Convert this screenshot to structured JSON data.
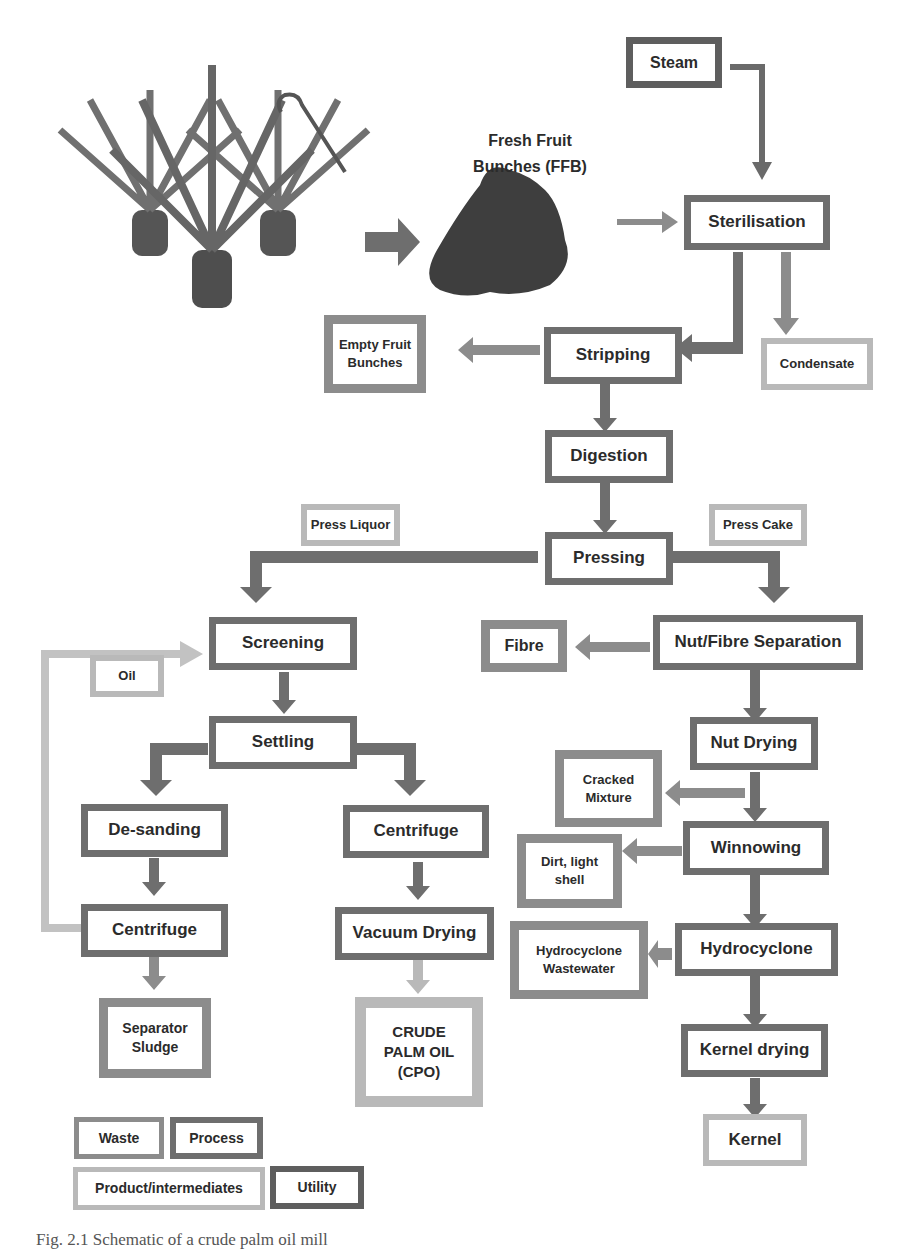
{
  "figure": {
    "caption_partial": "Fig. 2.1 Schematic of a crude palm oil mill",
    "ffb_label_line1": "Fresh Fruit",
    "ffb_label_line2": "Bunches (FFB)",
    "illustrations": [
      "oil-palm-trees",
      "harvesting-sickle",
      "fresh-fruit-bunch-pile"
    ]
  },
  "colors": {
    "process": "#6e6e6e",
    "waste": "#8c8c8c",
    "product": "#b9b9b9",
    "utility": "#5e5e5e",
    "arrow_process": "#6e6e6e",
    "arrow_waste": "#8c8c8c",
    "arrow_product": "#b9b9b9"
  },
  "nodes": {
    "steam": "Steam",
    "sterilisation": "Sterilisation",
    "stripping": "Stripping",
    "empty_fruit_bunches": "Empty Fruit Bunches",
    "condensate": "Condensate",
    "digestion": "Digestion",
    "pressing": "Pressing",
    "press_liquor": "Press Liquor",
    "press_cake": "Press Cake",
    "screening": "Screening",
    "oil": "Oil",
    "settling": "Settling",
    "desanding": "De-sanding",
    "centrifuge_left": "Centrifuge",
    "separator_sludge": "Separator Sludge",
    "centrifuge_mid": "Centrifuge",
    "vacuum_drying": "Vacuum Drying",
    "cpo_line1": "CRUDE",
    "cpo_line2": "PALM OIL",
    "cpo_line3": "(CPO)",
    "fibre": "Fibre",
    "nut_fibre_separation": "Nut/Fibre Separation",
    "nut_drying": "Nut Drying",
    "cracked_mixture": "Cracked Mixture",
    "winnowing": "Winnowing",
    "dirt_light_shell": "Dirt, light shell",
    "hydrocyclone": "Hydrocyclone",
    "hydrocyclone_wastewater": "Hydrocyclone Wastewater",
    "kernel_drying": "Kernel drying",
    "kernel": "Kernel"
  },
  "legend": {
    "waste": "Waste",
    "process": "Process",
    "product": "Product/intermediates",
    "utility": "Utility"
  }
}
